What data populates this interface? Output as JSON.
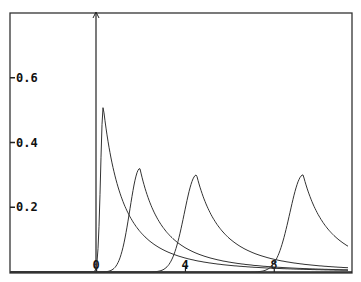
{
  "chart_data": {
    "type": "line",
    "title": "",
    "xlabel": "",
    "ylabel": "",
    "xlim": [
      -3.9,
      11.5
    ],
    "ylim": [
      0,
      0.8
    ],
    "grid": false,
    "legend": null,
    "x_ticks": [
      0,
      4,
      8
    ],
    "x_tick_labels": [
      "0",
      "4",
      "8"
    ],
    "y_ticks": [
      0.2,
      0.4,
      0.6
    ],
    "y_tick_labels": [
      "0.2",
      "0.4",
      "0.6"
    ],
    "series": [
      {
        "name": "curve-1",
        "peak_x": 0.3,
        "peak_y": 0.51,
        "rise": 0.12,
        "decay": 2.0
      },
      {
        "name": "curve-2",
        "peak_x": 1.95,
        "peak_y": 0.32,
        "rise": 0.45,
        "decay": 2.4
      },
      {
        "name": "curve-3",
        "peak_x": 4.5,
        "peak_y": 0.3,
        "rise": 0.55,
        "decay": 2.6
      },
      {
        "name": "curve-4",
        "peak_x": 9.3,
        "peak_y": 0.3,
        "rise": 0.6,
        "decay": 2.7
      }
    ]
  }
}
